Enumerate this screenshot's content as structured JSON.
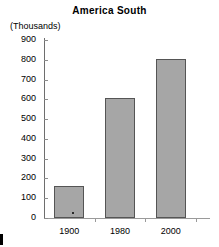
{
  "chart_data": {
    "type": "bar",
    "title": "America South",
    "xlabel": "",
    "ylabel": "(Thousands)",
    "categories": [
      "1900",
      "1980",
      "2000"
    ],
    "values": [
      160,
      605,
      805
    ],
    "ylim": [
      0,
      900
    ],
    "ytick_labels": [
      "900",
      "800",
      "700",
      "600",
      "500",
      "400",
      "300",
      "200",
      "100",
      "0"
    ],
    "ytick_values": [
      900,
      800,
      700,
      600,
      500,
      400,
      300,
      200,
      100,
      0
    ],
    "grid": false,
    "legend": "none",
    "series": [
      {
        "name": "America South",
        "values": [
          160,
          605,
          805
        ]
      }
    ],
    "colors": {
      "bar_fill": "#a6a6a6",
      "bar_border": "#555555",
      "axis": "#8d8d8d",
      "text": "#000000",
      "background": "#ffffff"
    }
  }
}
